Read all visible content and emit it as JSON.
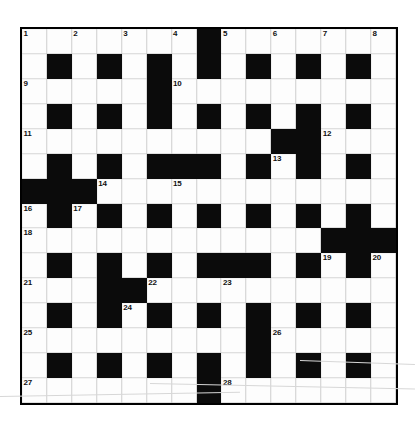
{
  "puzzle": {
    "title": "Crossword Grid",
    "size": {
      "rows": 15,
      "cols": 15
    },
    "colors": {
      "block": "#0b0b0b",
      "cell": "#fdfdfd",
      "border": "#000000",
      "number": "#111111"
    },
    "black_squares": [
      [
        0,
        7
      ],
      [
        1,
        1
      ],
      [
        1,
        3
      ],
      [
        1,
        5
      ],
      [
        1,
        7
      ],
      [
        1,
        9
      ],
      [
        1,
        11
      ],
      [
        1,
        13
      ],
      [
        2,
        5
      ],
      [
        3,
        1
      ],
      [
        3,
        3
      ],
      [
        3,
        5
      ],
      [
        3,
        7
      ],
      [
        3,
        9
      ],
      [
        3,
        11
      ],
      [
        3,
        13
      ],
      [
        4,
        10
      ],
      [
        4,
        11
      ],
      [
        5,
        1
      ],
      [
        5,
        3
      ],
      [
        5,
        5
      ],
      [
        5,
        6
      ],
      [
        5,
        7
      ],
      [
        5,
        9
      ],
      [
        5,
        11
      ],
      [
        5,
        13
      ],
      [
        6,
        0
      ],
      [
        6,
        1
      ],
      [
        6,
        2
      ],
      [
        7,
        1
      ],
      [
        7,
        3
      ],
      [
        7,
        5
      ],
      [
        7,
        7
      ],
      [
        7,
        9
      ],
      [
        7,
        11
      ],
      [
        7,
        13
      ],
      [
        8,
        12
      ],
      [
        8,
        13
      ],
      [
        8,
        14
      ],
      [
        9,
        1
      ],
      [
        9,
        3
      ],
      [
        9,
        5
      ],
      [
        9,
        7
      ],
      [
        9,
        8
      ],
      [
        9,
        9
      ],
      [
        9,
        11
      ],
      [
        9,
        13
      ],
      [
        10,
        3
      ],
      [
        10,
        4
      ],
      [
        11,
        1
      ],
      [
        11,
        3
      ],
      [
        11,
        5
      ],
      [
        11,
        7
      ],
      [
        11,
        9
      ],
      [
        11,
        11
      ],
      [
        11,
        13
      ],
      [
        12,
        9
      ],
      [
        13,
        1
      ],
      [
        13,
        3
      ],
      [
        13,
        5
      ],
      [
        13,
        7
      ],
      [
        13,
        9
      ],
      [
        13,
        11
      ],
      [
        13,
        13
      ],
      [
        14,
        7
      ]
    ],
    "numbers": [
      {
        "n": "1",
        "row": 0,
        "col": 0
      },
      {
        "n": "2",
        "row": 0,
        "col": 2
      },
      {
        "n": "3",
        "row": 0,
        "col": 4
      },
      {
        "n": "4",
        "row": 0,
        "col": 6
      },
      {
        "n": "5",
        "row": 0,
        "col": 8
      },
      {
        "n": "6",
        "row": 0,
        "col": 10
      },
      {
        "n": "7",
        "row": 0,
        "col": 12
      },
      {
        "n": "8",
        "row": 0,
        "col": 14
      },
      {
        "n": "9",
        "row": 2,
        "col": 0
      },
      {
        "n": "10",
        "row": 2,
        "col": 6
      },
      {
        "n": "11",
        "row": 4,
        "col": 0
      },
      {
        "n": "12",
        "row": 4,
        "col": 12
      },
      {
        "n": "13",
        "row": 5,
        "col": 10
      },
      {
        "n": "14",
        "row": 6,
        "col": 3
      },
      {
        "n": "15",
        "row": 6,
        "col": 6
      },
      {
        "n": "16",
        "row": 7,
        "col": 0
      },
      {
        "n": "17",
        "row": 7,
        "col": 2
      },
      {
        "n": "18",
        "row": 8,
        "col": 0
      },
      {
        "n": "19",
        "row": 9,
        "col": 12
      },
      {
        "n": "20",
        "row": 9,
        "col": 14
      },
      {
        "n": "21",
        "row": 10,
        "col": 0
      },
      {
        "n": "22",
        "row": 10,
        "col": 5
      },
      {
        "n": "23",
        "row": 10,
        "col": 8
      },
      {
        "n": "24",
        "row": 11,
        "col": 4
      },
      {
        "n": "25",
        "row": 12,
        "col": 0
      },
      {
        "n": "26",
        "row": 12,
        "col": 10
      },
      {
        "n": "27",
        "row": 14,
        "col": 0
      },
      {
        "n": "28",
        "row": 14,
        "col": 8
      }
    ]
  }
}
